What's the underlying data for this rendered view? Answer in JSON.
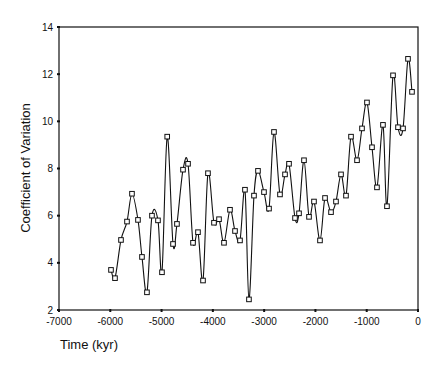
{
  "chart_data": {
    "type": "line",
    "title": "",
    "xlabel": "Time (kyr)",
    "ylabel": "Coefficient of Variation",
    "xlim": [
      -7000,
      0
    ],
    "ylim": [
      2,
      14
    ],
    "x_ticks": [
      -7000,
      -6000,
      -5000,
      -4000,
      -3000,
      -2000,
      -1000,
      0
    ],
    "y_ticks": [
      2,
      4,
      6,
      8,
      10,
      12,
      14
    ],
    "grid": false,
    "legend": null,
    "marker": "open-square",
    "line_style": "smoothed-spline",
    "series": [
      {
        "name": "Coefficient of Variation",
        "x": [
          -5986,
          -5908,
          -5791,
          -5674,
          -5577,
          -5460,
          -5382,
          -5285,
          -5187,
          -5070,
          -4992,
          -4890,
          -4777,
          -4700,
          -4582,
          -4484,
          -4387,
          -4290,
          -4192,
          -4095,
          -3978,
          -3880,
          -3783,
          -3666,
          -3568,
          -3471,
          -3374,
          -3296,
          -3198,
          -3120,
          -3003,
          -2905,
          -2808,
          -2691,
          -2593,
          -2515,
          -2398,
          -2320,
          -2223,
          -2125,
          -2028,
          -1911,
          -1813,
          -1696,
          -1599,
          -1501,
          -1404,
          -1306,
          -1189,
          -1092,
          -995,
          -897,
          -800,
          -683,
          -605,
          -487,
          -390,
          -292,
          -195,
          -117
        ],
        "y": [
          3.7,
          3.35,
          4.97,
          5.75,
          6.93,
          5.82,
          4.25,
          2.75,
          6.0,
          5.8,
          3.6,
          9.35,
          4.8,
          5.65,
          7.95,
          8.2,
          4.85,
          5.3,
          3.25,
          7.8,
          5.7,
          5.85,
          4.85,
          6.25,
          5.35,
          4.95,
          7.1,
          2.45,
          6.85,
          7.9,
          7.0,
          6.3,
          9.55,
          6.9,
          7.75,
          8.2,
          5.9,
          6.1,
          8.35,
          5.95,
          6.6,
          4.95,
          6.75,
          6.15,
          6.6,
          7.75,
          6.85,
          9.35,
          8.35,
          9.7,
          10.8,
          8.9,
          7.2,
          9.85,
          6.4,
          11.95,
          9.75,
          9.7,
          12.65,
          11.25
        ]
      }
    ]
  },
  "colors": {
    "line": "#111111",
    "marker_fill": "#ffffff",
    "axis": "#111111",
    "background": "#ffffff"
  }
}
